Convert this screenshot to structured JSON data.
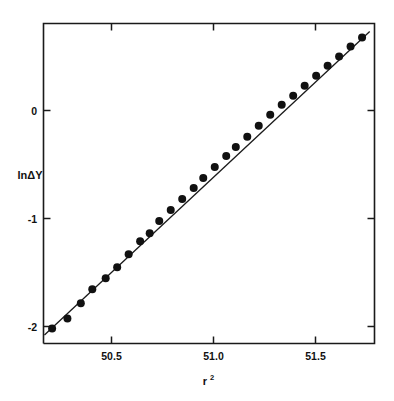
{
  "chart_data": {
    "type": "scatter",
    "title": "",
    "subtitle": "",
    "xlabel": "r²",
    "xlabel_base": "r",
    "xlabel_exponent": "2",
    "ylabel": "lnΔY",
    "xlim": [
      50.12,
      51.85
    ],
    "ylim": [
      -2.32,
      0.87
    ],
    "xticks": [
      50.5,
      51.0,
      51.5
    ],
    "xtick_labels": [
      "50.5",
      "51.0",
      "51.5"
    ],
    "yticks": [
      0,
      -1,
      -2
    ],
    "ytick_labels": [
      "0",
      "-1",
      "-2"
    ],
    "grid": false,
    "legend": null,
    "marker": "filled-circle",
    "marker_color": "#111111",
    "line_color": "#1a1a1a",
    "frame_color": "#1a1a1a",
    "background": "#ffffff",
    "series": [
      {
        "name": "data",
        "type": "scatter",
        "x": [
          50.165,
          50.245,
          50.315,
          50.375,
          50.445,
          50.505,
          50.565,
          50.625,
          50.675,
          50.725,
          50.785,
          50.845,
          50.905,
          50.955,
          51.015,
          51.075,
          51.125,
          51.185,
          51.245,
          51.305,
          51.365,
          51.425,
          51.485,
          51.545,
          51.605,
          51.665,
          51.725,
          51.785
        ],
        "y": [
          -2.17,
          -2.07,
          -1.92,
          -1.78,
          -1.67,
          -1.56,
          -1.43,
          -1.3,
          -1.22,
          -1.1,
          -0.99,
          -0.88,
          -0.77,
          -0.67,
          -0.56,
          -0.45,
          -0.36,
          -0.26,
          -0.15,
          -0.04,
          0.06,
          0.15,
          0.25,
          0.35,
          0.45,
          0.54,
          0.64,
          0.73
        ]
      },
      {
        "name": "linear fit",
        "type": "line",
        "x": [
          50.125,
          51.825
        ],
        "y": [
          -2.235,
          0.79
        ],
        "slope": 1.78,
        "intercept": -91.5
      }
    ],
    "n_points": 28,
    "annotations": []
  },
  "figure": {
    "axis_label_x": "r²",
    "axis_label_y": "lnΔY"
  }
}
